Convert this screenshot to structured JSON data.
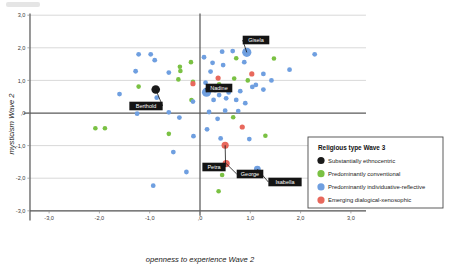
{
  "chart_data": {
    "type": "scatter",
    "title": "",
    "xlabel": "openness to experience Wave 2",
    "ylabel": "mysticism  Wave 2",
    "xlim": [
      -3.5,
      3.5
    ],
    "ylim": [
      -3.4,
      3.4
    ],
    "xticks": [
      "-3,0",
      "-2,0",
      "-1,0",
      ",0",
      "1,0",
      "2,0",
      "3,0"
    ],
    "xtick_values": [
      -3.0,
      -2.0,
      -1.0,
      0.0,
      1.0,
      2.0,
      3.0
    ],
    "yticks": [
      "3,0",
      "2,0",
      "1,0",
      ",0",
      "-1,0",
      "-2,0",
      "-3,0"
    ],
    "ytick_values": [
      3.0,
      2.0,
      1.0,
      0.0,
      -1.0,
      -2.0,
      -3.0
    ],
    "grid": true,
    "legend_position": "right-bottom",
    "colors": {
      "substantially_ethnocentric": "#1a1a1a",
      "predominantly_conventional": "#7ac143",
      "predominantly_individuative_reflective": "#6f9fe0",
      "emerging_dialogical_xenosophic": "#e8685c"
    },
    "series": [
      {
        "name": "Substantially ethnocentric",
        "color": "#1a1a1a",
        "points": [
          {
            "x": -0.88,
            "y": 0.72,
            "r": 4.3,
            "label": "Berthold"
          }
        ]
      },
      {
        "name": "Predominantly conventional",
        "color": "#7ac143",
        "points": [
          {
            "x": -2.08,
            "y": -0.47,
            "r": 2.3
          },
          {
            "x": -1.89,
            "y": -0.47,
            "r": 2.3
          },
          {
            "x": -1.22,
            "y": 0.81,
            "r": 2.3
          },
          {
            "x": -0.62,
            "y": -0.64,
            "r": 2.3
          },
          {
            "x": -0.4,
            "y": 1.42,
            "r": 2.3
          },
          {
            "x": -0.39,
            "y": 1.29,
            "r": 2.3
          },
          {
            "x": -0.43,
            "y": 1.03,
            "r": 2.3
          },
          {
            "x": -0.18,
            "y": 1.56,
            "r": 2.3
          },
          {
            "x": -0.17,
            "y": 0.4,
            "r": 2.3
          },
          {
            "x": -0.14,
            "y": 0.96,
            "r": 2.3
          },
          {
            "x": 0.38,
            "y": 0.88,
            "r": 2.3
          },
          {
            "x": 0.37,
            "y": -2.4,
            "r": 2.3
          },
          {
            "x": 0.44,
            "y": -1.9,
            "r": 2.3
          },
          {
            "x": 0.66,
            "y": -0.13,
            "r": 2.3
          },
          {
            "x": 0.68,
            "y": 1.06,
            "r": 2.3
          },
          {
            "x": 0.72,
            "y": 1.68,
            "r": 2.3
          },
          {
            "x": 0.95,
            "y": 1.0,
            "r": 2.3
          },
          {
            "x": 1.3,
            "y": -0.7,
            "r": 2.3
          },
          {
            "x": 1.47,
            "y": 1.67,
            "r": 2.3
          }
        ]
      },
      {
        "name": "Predominantly individuative-reflective",
        "color": "#6f9fe0",
        "points": [
          {
            "x": -1.6,
            "y": 0.58,
            "r": 2.4
          },
          {
            "x": -1.28,
            "y": 1.28,
            "r": 2.4
          },
          {
            "x": -1.22,
            "y": 1.8,
            "r": 2.4
          },
          {
            "x": -1.24,
            "y": 0.17,
            "r": 2.4
          },
          {
            "x": -1.25,
            "y": -0.02,
            "r": 2.4
          },
          {
            "x": -0.98,
            "y": 1.8,
            "r": 2.4
          },
          {
            "x": -0.9,
            "y": 1.62,
            "r": 2.4
          },
          {
            "x": -0.86,
            "y": 0.47,
            "r": 2.4
          },
          {
            "x": -0.62,
            "y": 1.24,
            "r": 2.4
          },
          {
            "x": -0.62,
            "y": 0.02,
            "r": 2.4
          },
          {
            "x": -0.53,
            "y": -1.2,
            "r": 2.4
          },
          {
            "x": -0.41,
            "y": -0.14,
            "r": 2.4
          },
          {
            "x": -0.27,
            "y": -1.81,
            "r": 2.4
          },
          {
            "x": -0.14,
            "y": 0.35,
            "r": 2.4
          },
          {
            "x": -0.13,
            "y": -0.71,
            "r": 2.4
          },
          {
            "x": -0.93,
            "y": -2.23,
            "r": 2.4
          },
          {
            "x": 0.08,
            "y": 1.71,
            "r": 2.4
          },
          {
            "x": 0.11,
            "y": 0.93,
            "r": 2.4
          },
          {
            "x": 0.13,
            "y": 0.64,
            "r": 4.6,
            "label": "Nadine"
          },
          {
            "x": 0.14,
            "y": -0.5,
            "r": 2.4
          },
          {
            "x": 0.18,
            "y": 0.03,
            "r": 2.4
          },
          {
            "x": 0.21,
            "y": 1.27,
            "r": 2.4
          },
          {
            "x": 0.25,
            "y": 1.54,
            "r": 2.4
          },
          {
            "x": 0.27,
            "y": 0.4,
            "r": 2.4
          },
          {
            "x": 0.3,
            "y": 0.7,
            "r": 2.4
          },
          {
            "x": 0.35,
            "y": -0.18,
            "r": 2.4
          },
          {
            "x": 0.38,
            "y": 0.55,
            "r": 2.4
          },
          {
            "x": 0.41,
            "y": -0.78,
            "r": 2.4
          },
          {
            "x": 0.44,
            "y": 1.88,
            "r": 2.4
          },
          {
            "x": 0.46,
            "y": 1.47,
            "r": 2.4
          },
          {
            "x": 0.5,
            "y": 0.07,
            "r": 2.4
          },
          {
            "x": 0.52,
            "y": 0.45,
            "r": 2.4
          },
          {
            "x": 0.57,
            "y": 0.63,
            "r": 2.4
          },
          {
            "x": 0.65,
            "y": 1.9,
            "r": 2.4
          },
          {
            "x": 0.72,
            "y": 0.4,
            "r": 2.4
          },
          {
            "x": 0.76,
            "y": 0.06,
            "r": 2.4
          },
          {
            "x": 0.8,
            "y": 0.67,
            "r": 2.4
          },
          {
            "x": 0.88,
            "y": 1.56,
            "r": 2.4
          },
          {
            "x": 0.9,
            "y": 0.3,
            "r": 2.4
          },
          {
            "x": 0.93,
            "y": 1.86,
            "r": 4.6,
            "label": "Gisela"
          },
          {
            "x": 0.98,
            "y": -0.8,
            "r": 2.4
          },
          {
            "x": 1.04,
            "y": 0.8,
            "r": 2.4
          },
          {
            "x": 1.11,
            "y": 0.86,
            "r": 2.4
          },
          {
            "x": 1.14,
            "y": -1.72,
            "r": 3.4,
            "label": "Isabella"
          },
          {
            "x": 1.26,
            "y": 0.72,
            "r": 2.4
          },
          {
            "x": 1.26,
            "y": 1.2,
            "r": 2.4
          },
          {
            "x": 1.42,
            "y": 1.0,
            "r": 2.4
          },
          {
            "x": 1.78,
            "y": 1.33,
            "r": 2.4
          },
          {
            "x": 2.28,
            "y": 1.8,
            "r": 2.4
          }
        ]
      },
      {
        "name": "Emerging dialogical-xenosophic",
        "color": "#e8685c",
        "points": [
          {
            "x": -0.14,
            "y": 0.9,
            "r": 2.6
          },
          {
            "x": 0.36,
            "y": 1.07,
            "r": 2.6
          },
          {
            "x": 0.5,
            "y": -0.99,
            "r": 3.6,
            "label": "Petra"
          },
          {
            "x": 0.52,
            "y": -1.55,
            "r": 3.6,
            "label": "George"
          },
          {
            "x": 0.84,
            "y": -0.43,
            "r": 2.6
          },
          {
            "x": 1.03,
            "y": 1.2,
            "r": 2.6
          }
        ]
      }
    ],
    "annotations": [
      {
        "text": "Gisela",
        "point": {
          "x": 0.93,
          "y": 1.86
        },
        "box": {
          "cx": 256,
          "cy": 40
        }
      },
      {
        "text": "Nadine",
        "point": {
          "x": 0.13,
          "y": 0.64
        },
        "box": {
          "cx": 219,
          "cy": 88
        }
      },
      {
        "text": "Berthold",
        "point": {
          "x": -0.88,
          "y": 0.72
        },
        "box": {
          "cx": 146,
          "cy": 106
        }
      },
      {
        "text": "Petra",
        "point": {
          "x": 0.5,
          "y": -0.99
        },
        "box": {
          "cx": 214,
          "cy": 167
        }
      },
      {
        "text": "George",
        "point": {
          "x": 0.52,
          "y": -1.55
        },
        "box": {
          "cx": 250,
          "cy": 174
        }
      },
      {
        "text": "Isabella",
        "point": {
          "x": 1.14,
          "y": -1.72
        },
        "box": {
          "cx": 285,
          "cy": 182
        }
      }
    ]
  },
  "legend": {
    "title": "Religious type  Wave 3",
    "items": [
      {
        "label": "Substantially ethnocentric",
        "color": "#1a1a1a"
      },
      {
        "label": "Predominantly conventional",
        "color": "#7ac143"
      },
      {
        "label": "Predominantly individuative-reflective",
        "color": "#6f9fe0"
      },
      {
        "label": "Emerging dialogical-xenosophic",
        "color": "#e8685c"
      }
    ]
  }
}
